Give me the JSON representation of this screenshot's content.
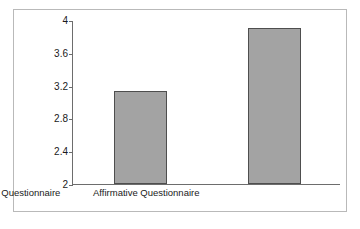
{
  "chart_data": {
    "type": "bar",
    "title": "",
    "subtitle": "",
    "xlabel": "",
    "ylabel": "Mean Scores",
    "categories": [
      "Balanced Questionnaire",
      "Affirmative Questionnaire"
    ],
    "values": [
      3.13,
      3.9
    ],
    "ylim": [
      2,
      4
    ],
    "yticks": [
      2,
      2.4,
      2.8,
      3.2,
      3.6,
      4
    ],
    "ytick_labels": [
      "2",
      "2.4",
      "2.8",
      "3.2",
      "3.6",
      "4"
    ],
    "grid": false,
    "legend": null,
    "legend_position": "none",
    "bar_fill_color": "#a3a3a3",
    "bar_edge_color": "#4e4e4e",
    "axis_color": "#6d6d6d",
    "frame_color": "#b9b9b9",
    "text_color": "#1a1a1a",
    "background_color": "#ffffff"
  }
}
